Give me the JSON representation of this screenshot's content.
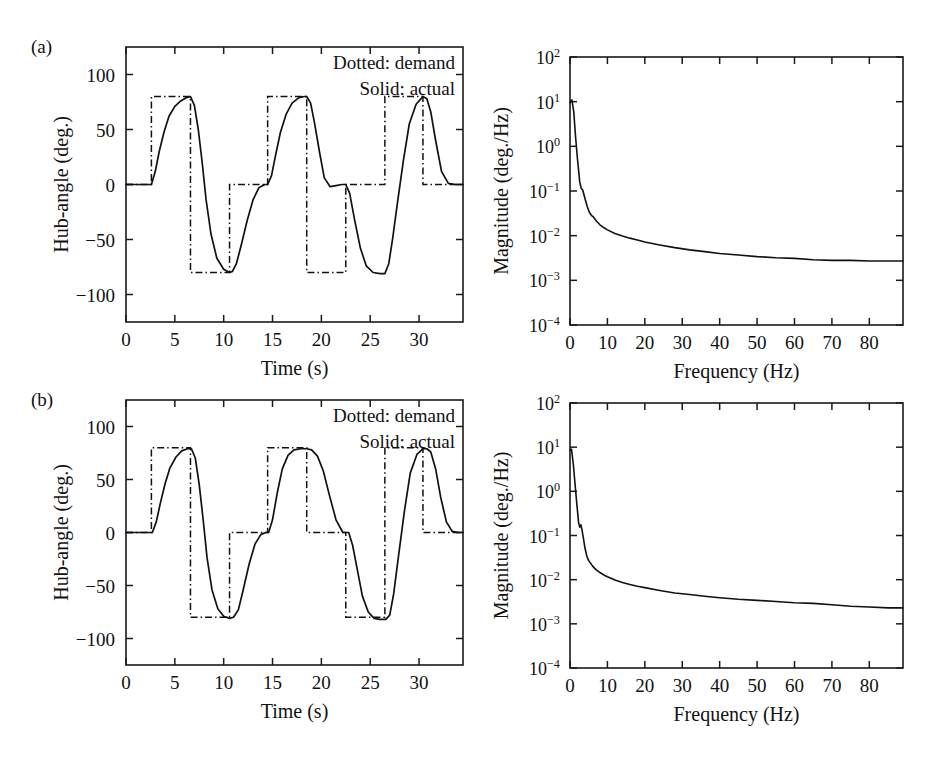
{
  "figure": {
    "panels": [
      {
        "tag": "(a)"
      },
      {
        "tag": "(b)"
      }
    ]
  },
  "legend": {
    "demand_label": "Dotted: demand",
    "actual_label": "Solid: actual"
  },
  "axes": {
    "time": {
      "label": "Time (s)",
      "ticks": [
        "0",
        "5",
        "10",
        "15",
        "20",
        "25",
        "30"
      ],
      "tick_values": [
        0,
        5,
        10,
        15,
        20,
        25,
        30
      ],
      "range": [
        0,
        34.5
      ]
    },
    "hub": {
      "label": "Hub-angle (deg.)",
      "ticks": [
        "100",
        "50",
        "0",
        "−50",
        "−100"
      ],
      "tick_values": [
        100,
        50,
        0,
        -50,
        -100
      ],
      "range": [
        -125,
        125
      ]
    },
    "freq": {
      "label": "Frequency (Hz)",
      "ticks": [
        "0",
        "10",
        "20",
        "30",
        "40",
        "50",
        "60",
        "70",
        "80"
      ],
      "tick_values": [
        0,
        10,
        20,
        30,
        40,
        50,
        60,
        70,
        80
      ],
      "range": [
        0,
        89
      ]
    },
    "mag": {
      "label": "Magnitude (deg./Hz)",
      "ticks": [
        "10",
        "10",
        "10",
        "10",
        "10",
        "10",
        "10"
      ],
      "exponents": [
        "2",
        "1",
        "0",
        "−1",
        "−2",
        "−3",
        "−4"
      ],
      "tick_values": [
        100,
        10,
        1,
        0.1,
        0.01,
        0.001,
        0.0001
      ],
      "range": [
        0.0001,
        100
      ]
    }
  },
  "chart_data": [
    {
      "id": "a-time",
      "type": "line",
      "title": "",
      "xlabel": "Time (s)",
      "ylabel": "Hub-angle (deg.)",
      "xlim": [
        0,
        34.5
      ],
      "ylim": [
        -125,
        125
      ],
      "grid": false,
      "legend_position": "top-right",
      "series": [
        {
          "name": "Dotted: demand",
          "style": "dash-dot",
          "x": [
            0,
            2.6,
            2.6,
            6.6,
            6.6,
            10.6,
            10.6,
            14.5,
            14.5,
            18.5,
            18.5,
            22.5,
            22.5,
            26.5,
            26.5,
            30.4,
            30.4,
            34.5
          ],
          "y": [
            0,
            0,
            80,
            80,
            -80,
            -80,
            0,
            0,
            80,
            80,
            -80,
            -80,
            0,
            0,
            80,
            80,
            0,
            0
          ]
        },
        {
          "name": "Solid: actual",
          "style": "solid",
          "x": [
            0,
            2.6,
            3.0,
            3.4,
            3.9,
            4.4,
            5.0,
            5.6,
            6.2,
            6.6,
            7.0,
            7.4,
            7.8,
            8.2,
            8.7,
            9.3,
            10.0,
            10.6,
            10.9,
            11.3,
            11.8,
            12.4,
            13.0,
            13.6,
            14.2,
            14.5,
            14.9,
            15.3,
            15.8,
            16.4,
            17.0,
            17.7,
            18.3,
            18.5,
            18.9,
            19.3,
            19.8,
            20.3,
            20.9,
            21.5,
            22.1,
            22.5,
            22.9,
            23.4,
            24.0,
            24.6,
            25.3,
            26.0,
            26.5,
            26.9,
            27.3,
            27.8,
            28.4,
            29.0,
            29.7,
            30.3,
            30.4,
            30.8,
            31.2,
            31.7,
            32.3,
            33.0,
            33.7,
            34.5
          ],
          "y": [
            0,
            0,
            12,
            30,
            48,
            62,
            71,
            76,
            79,
            80,
            72,
            50,
            20,
            -14,
            -45,
            -67,
            -77,
            -80,
            -79,
            -72,
            -55,
            -33,
            -14,
            -3,
            0,
            0,
            8,
            26,
            47,
            64,
            74,
            79,
            80,
            80,
            74,
            56,
            30,
            6,
            -2,
            -1,
            0,
            0,
            -8,
            -32,
            -58,
            -74,
            -80,
            -81,
            -81,
            -72,
            -49,
            -16,
            22,
            55,
            73,
            79,
            80,
            78,
            66,
            40,
            12,
            1,
            0,
            0
          ]
        }
      ]
    },
    {
      "id": "a-spectrum",
      "type": "line",
      "title": "",
      "xlabel": "Frequency (Hz)",
      "ylabel": "Magnitude (deg./Hz)",
      "xlim": [
        0,
        89
      ],
      "ylim": [
        0.0001,
        100
      ],
      "yscale": "log",
      "grid": false,
      "series": [
        {
          "name": "spectrum",
          "style": "solid",
          "x": [
            0.0,
            0.5,
            1.0,
            1.5,
            2.0,
            2.6,
            3.0,
            3.4,
            4.0,
            4.6,
            5.2,
            5.8,
            6.2,
            7.0,
            8.0,
            9.0,
            10.0,
            12.0,
            14.0,
            16.0,
            18.0,
            20.0,
            24.0,
            28.0,
            32.0,
            36.0,
            40.0,
            45.0,
            50.0,
            55.0,
            60.0,
            65.0,
            70.0,
            75.0,
            80.0,
            85.0,
            89.0
          ],
          "y": [
            9.5,
            11.0,
            6.0,
            1.6,
            0.52,
            0.16,
            0.115,
            0.105,
            0.068,
            0.045,
            0.033,
            0.028,
            0.0265,
            0.0215,
            0.0175,
            0.0152,
            0.0135,
            0.0112,
            0.0098,
            0.0088,
            0.008,
            0.0072,
            0.0062,
            0.0054,
            0.0048,
            0.0044,
            0.004,
            0.0037,
            0.0034,
            0.0032,
            0.0031,
            0.0029,
            0.0028,
            0.0028,
            0.0027,
            0.0027,
            0.0027
          ]
        }
      ]
    },
    {
      "id": "b-time",
      "type": "line",
      "title": "",
      "xlabel": "Time (s)",
      "ylabel": "Hub-angle (deg.)",
      "xlim": [
        0,
        34.5
      ],
      "ylim": [
        -125,
        125
      ],
      "grid": false,
      "legend_position": "top-right",
      "series": [
        {
          "name": "Dotted: demand",
          "style": "dash-dot",
          "x": [
            0,
            2.6,
            2.6,
            6.6,
            6.6,
            10.6,
            10.6,
            14.5,
            14.5,
            18.5,
            18.5,
            22.5,
            22.5,
            26.5,
            26.5,
            30.4,
            30.4,
            34.5
          ],
          "y": [
            0,
            0,
            80,
            80,
            -80,
            -80,
            0,
            0,
            80,
            80,
            0,
            0,
            -80,
            -80,
            80,
            80,
            0,
            0
          ]
        },
        {
          "name": "Solid: actual",
          "style": "solid",
          "x": [
            0,
            2.7,
            3.1,
            3.5,
            4.0,
            4.5,
            5.1,
            5.7,
            6.3,
            6.7,
            7.1,
            7.5,
            7.9,
            8.3,
            8.8,
            9.4,
            10.0,
            10.6,
            11.0,
            11.5,
            12.0,
            12.6,
            13.2,
            13.8,
            14.3,
            14.6,
            15.0,
            15.5,
            16.0,
            16.6,
            17.2,
            17.9,
            18.5,
            19.0,
            19.6,
            20.2,
            20.8,
            21.5,
            22.2,
            22.8,
            23.2,
            23.7,
            24.2,
            24.8,
            25.4,
            26.0,
            26.6,
            27.0,
            27.4,
            27.9,
            28.5,
            29.1,
            29.8,
            30.4,
            30.8,
            31.2,
            31.7,
            32.2,
            32.8,
            33.4,
            34.0,
            34.5
          ],
          "y": [
            0,
            0,
            10,
            27,
            46,
            61,
            71,
            77,
            79,
            79,
            70,
            45,
            12,
            -24,
            -54,
            -72,
            -79,
            -81,
            -80,
            -73,
            -54,
            -30,
            -11,
            -2,
            0,
            0,
            12,
            38,
            60,
            73,
            78,
            79,
            79,
            78,
            72,
            58,
            36,
            12,
            0,
            0,
            -12,
            -36,
            -60,
            -75,
            -81,
            -82,
            -82,
            -78,
            -58,
            -22,
            20,
            56,
            74,
            79,
            79,
            76,
            60,
            34,
            10,
            1,
            0,
            0
          ]
        }
      ]
    },
    {
      "id": "b-spectrum",
      "type": "line",
      "title": "",
      "xlabel": "Frequency (Hz)",
      "ylabel": "Magnitude (deg./Hz)",
      "xlim": [
        0,
        89
      ],
      "ylim": [
        0.0001,
        100
      ],
      "yscale": "log",
      "grid": false,
      "series": [
        {
          "name": "spectrum",
          "style": "solid",
          "x": [
            0.0,
            0.4,
            0.9,
            1.4,
            1.9,
            2.3,
            2.6,
            2.9,
            3.2,
            3.6,
            4.0,
            4.5,
            5.0,
            5.5,
            6.0,
            6.6,
            7.2,
            8.0,
            9.0,
            10.0,
            12.0,
            14.0,
            16.0,
            18.0,
            20.0,
            24.0,
            28.0,
            32.0,
            36.0,
            40.0,
            45.0,
            50.0,
            55.0,
            60.0,
            65.0,
            70.0,
            75.0,
            80.0,
            85.0,
            89.0
          ],
          "y": [
            8.5,
            9.0,
            4.0,
            1.3,
            0.44,
            0.195,
            0.155,
            0.175,
            0.135,
            0.085,
            0.052,
            0.034,
            0.027,
            0.0235,
            0.0205,
            0.018,
            0.0162,
            0.0145,
            0.0128,
            0.0116,
            0.0098,
            0.0086,
            0.0078,
            0.0071,
            0.0066,
            0.0057,
            0.005,
            0.0046,
            0.0042,
            0.0039,
            0.0036,
            0.0034,
            0.0032,
            0.003,
            0.0029,
            0.0027,
            0.0025,
            0.0024,
            0.0023,
            0.0023
          ]
        }
      ]
    }
  ]
}
